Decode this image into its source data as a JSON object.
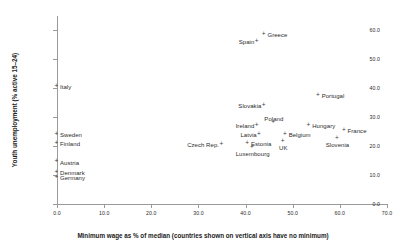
{
  "chart_data": {
    "type": "scatter",
    "title": "",
    "xlabel": "Minimum wage as % of median (countries shown on vertical axis have no minimum)",
    "ylabel": "Youth unemployment (% active 15–24)",
    "xlim": [
      0.0,
      70.0
    ],
    "ylim": [
      0.0,
      65.0
    ],
    "xticks": [
      "0.0",
      "10.0",
      "20.0",
      "30.0",
      "40.0",
      "50.0",
      "60.0",
      "70.0"
    ],
    "xtick_values": [
      0.0,
      10.0,
      20.0,
      30.0,
      40.0,
      50.0,
      60.0,
      70.0
    ],
    "yticks": [
      "0.0",
      "10.0",
      "20.0",
      "30.0",
      "40.0",
      "50.0",
      "60.0"
    ],
    "ytick_values": [
      0.0,
      10.0,
      20.0,
      30.0,
      40.0,
      50.0,
      60.0
    ],
    "grid": false,
    "legend": null,
    "marker": "+",
    "marker_color": "#3d3d3d",
    "points": [
      {
        "label": "Greece",
        "x": 44.0,
        "y": 58.0,
        "label_pos": "right"
      },
      {
        "label": "Spain",
        "x": 42.5,
        "y": 55.5,
        "label_pos": "left"
      },
      {
        "label": "Portugal",
        "x": 55.5,
        "y": 37.0,
        "label_pos": "right"
      },
      {
        "label": "Slovakia",
        "x": 44.0,
        "y": 33.5,
        "label_pos": "left"
      },
      {
        "label": "Poland",
        "x": 46.0,
        "y": 27.5,
        "label_pos": "above-c"
      },
      {
        "label": "Hungary",
        "x": 53.5,
        "y": 26.5,
        "label_pos": "right"
      },
      {
        "label": "Ireland",
        "x": 42.5,
        "y": 26.5,
        "label_pos": "left"
      },
      {
        "label": "France",
        "x": 61.0,
        "y": 25.0,
        "label_pos": "right"
      },
      {
        "label": "Belgium",
        "x": 48.5,
        "y": 23.5,
        "label_pos": "right"
      },
      {
        "label": "Latvia",
        "x": 43.0,
        "y": 23.5,
        "label_pos": "left"
      },
      {
        "label": "Slovenia",
        "x": 59.5,
        "y": 22.0,
        "label_pos": "below-c"
      },
      {
        "label": "UK",
        "x": 48.0,
        "y": 21.0,
        "label_pos": "below-c"
      },
      {
        "label": "Estonia",
        "x": 40.5,
        "y": 20.5,
        "label_pos": "right"
      },
      {
        "label": "Czech Rep.",
        "x": 35.0,
        "y": 20.0,
        "label_pos": "left"
      },
      {
        "label": "Luxembourg",
        "x": 41.5,
        "y": 19.0,
        "label_pos": "below-c"
      },
      {
        "label": "Italy",
        "x": 0.0,
        "y": 40.0,
        "label_pos": "right"
      },
      {
        "label": "Sweden",
        "x": 0.0,
        "y": 23.5,
        "label_pos": "right"
      },
      {
        "label": "Finland",
        "x": 0.0,
        "y": 20.5,
        "label_pos": "right"
      },
      {
        "label": "Austria",
        "x": 0.0,
        "y": 14.0,
        "label_pos": "right"
      },
      {
        "label": "Denmark",
        "x": 0.0,
        "y": 10.5,
        "label_pos": "right"
      },
      {
        "label": "Germany",
        "x": 0.0,
        "y": 8.5,
        "label_pos": "right"
      }
    ]
  }
}
